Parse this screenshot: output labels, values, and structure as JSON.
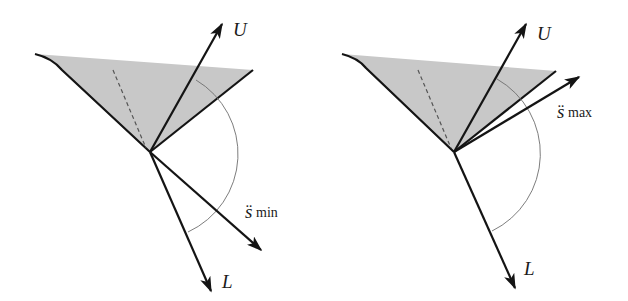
{
  "colors": {
    "background": "#ffffff",
    "shade": "#c8c8c8",
    "stroke": "#141414",
    "arc": "#6e6e6e"
  },
  "panels": [
    {
      "id": "left",
      "labels": {
        "upper": "U",
        "lower": "L",
        "accel_symbol": "s̈",
        "accel_sub": "min"
      }
    },
    {
      "id": "right",
      "labels": {
        "upper": "U",
        "lower": "L",
        "accel_symbol": "s̈",
        "accel_sub": "max"
      }
    }
  ]
}
